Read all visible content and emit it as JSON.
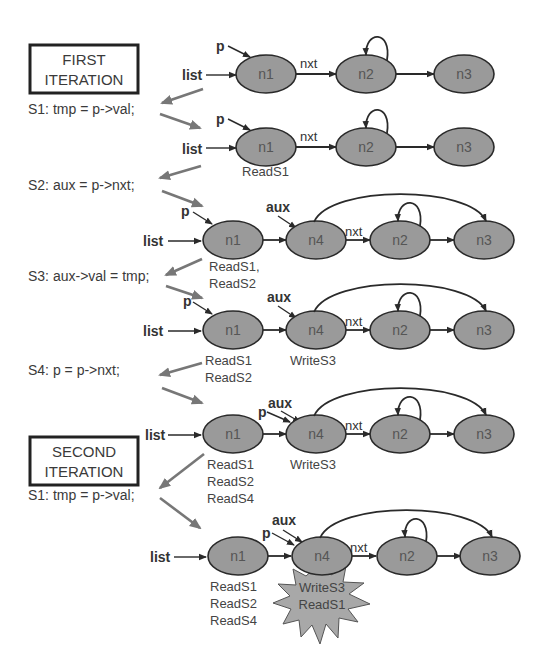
{
  "iterations": {
    "first": {
      "line1": "FIRST",
      "line2": "ITERATION"
    },
    "second": {
      "line1": "SECOND",
      "line2": "ITERATION"
    }
  },
  "statements": {
    "s1": "S1: tmp = p->val;",
    "s2": "S2: aux = p->nxt;",
    "s3": "S3: aux->val = tmp;",
    "s4": "S4: p = p->nxt;",
    "s1_second": "S1: tmp = p->val;"
  },
  "labels": {
    "list": "list",
    "p": "p",
    "aux": "aux",
    "nxt": "nxt"
  },
  "nodes": {
    "n1": "n1",
    "n2": "n2",
    "n3": "n3",
    "n4": "n4"
  },
  "rows": [
    {
      "id": "row1",
      "nodes": [
        "n1",
        "n2",
        "n3"
      ],
      "annotations": {}
    },
    {
      "id": "row2",
      "nodes": [
        "n1",
        "n2",
        "n3"
      ],
      "annotations": {
        "n1": [
          "ReadS1"
        ]
      }
    },
    {
      "id": "row3",
      "nodes": [
        "n1",
        "n4",
        "n2",
        "n3"
      ],
      "annotations": {
        "n1": [
          "ReadS1,",
          "ReadS2"
        ]
      }
    },
    {
      "id": "row4",
      "nodes": [
        "n1",
        "n4",
        "n2",
        "n3"
      ],
      "annotations": {
        "n1": [
          "ReadS1",
          "ReadS2"
        ],
        "n4": [
          "WriteS3"
        ]
      }
    },
    {
      "id": "row5",
      "nodes": [
        "n1",
        "n4",
        "n2",
        "n3"
      ],
      "annotations": {
        "n1": [
          "ReadS1",
          "ReadS2",
          "ReadS4"
        ],
        "n4": [
          "WriteS3"
        ]
      }
    },
    {
      "id": "row6",
      "nodes": [
        "n1",
        "n4",
        "n2",
        "n3"
      ],
      "annotations": {
        "n1": [
          "ReadS1",
          "ReadS2",
          "ReadS4"
        ],
        "n4_conflict": [
          "WriteS3",
          "ReadS1"
        ]
      }
    }
  ],
  "colors": {
    "node_fill": "#9a9a9a",
    "conflict_fill": "#a8a8a8",
    "flow_arrow": "#777777"
  }
}
